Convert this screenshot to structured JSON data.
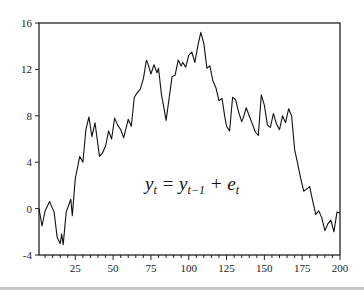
{
  "chart_data": {
    "type": "line",
    "title": "",
    "xlabel": "",
    "ylabel": "",
    "annotation": {
      "text_parts": [
        "y",
        "t",
        " = y",
        "t−1",
        " + e",
        "t"
      ],
      "latex": "y_t = y_{t-1} + e_t",
      "position": "center-lower"
    },
    "xlim": [
      1,
      200
    ],
    "ylim": [
      -4,
      16
    ],
    "grid": false,
    "legend": "none",
    "x_ticks": [
      25,
      50,
      75,
      100,
      125,
      150,
      175,
      200
    ],
    "x_minor_tick_step": 5,
    "y_ticks": [
      -4,
      0,
      4,
      8,
      12,
      16
    ],
    "series": [
      {
        "name": "random walk y_t",
        "color": "#111111",
        "x": [
          1,
          3,
          5,
          8,
          11,
          13,
          15,
          16,
          17,
          19,
          22,
          23,
          25,
          28,
          30,
          32,
          34,
          36,
          38,
          41,
          43,
          45,
          47,
          49,
          51,
          53,
          55,
          57,
          60,
          62,
          64,
          66,
          68,
          70,
          72,
          73,
          75,
          77,
          79,
          80,
          82,
          84,
          85,
          87,
          89,
          91,
          93,
          95,
          96,
          98,
          100,
          102,
          104,
          106,
          108,
          110,
          112,
          114,
          116,
          118,
          120,
          122,
          124,
          125,
          127,
          129,
          131,
          133,
          135,
          136,
          138,
          140,
          142,
          144,
          146,
          148,
          150,
          152,
          154,
          156,
          158,
          160,
          162,
          164,
          166,
          168,
          170,
          172,
          174,
          176,
          178,
          180,
          182,
          184,
          186,
          188,
          190,
          192,
          194,
          196,
          198,
          200
        ],
        "values": [
          0,
          -1.5,
          -0.2,
          0.6,
          -0.3,
          -2.5,
          -3.0,
          -2.2,
          -3.1,
          -0.3,
          0.8,
          -0.6,
          2.6,
          4.5,
          4.0,
          6.8,
          7.9,
          6.2,
          7.4,
          4.5,
          4.8,
          5.4,
          6.7,
          6.0,
          7.8,
          7.2,
          6.8,
          6.1,
          7.7,
          7.1,
          9.6,
          10.0,
          10.3,
          11.2,
          12.8,
          12.5,
          11.6,
          12.4,
          11.7,
          12.1,
          9.8,
          8.4,
          7.6,
          9.5,
          11.4,
          11.5,
          12.8,
          12.3,
          12.6,
          12.2,
          13.2,
          13.5,
          12.6,
          14.0,
          15.2,
          14.2,
          12.1,
          12.3,
          11.0,
          10.4,
          9.3,
          9.5,
          7.8,
          7.1,
          6.7,
          9.6,
          9.4,
          8.3,
          7.5,
          7.8,
          8.7,
          8.0,
          7.3,
          6.6,
          6.3,
          9.8,
          8.9,
          7.2,
          7.0,
          8.2,
          7.3,
          6.8,
          8.0,
          7.4,
          8.6,
          8.0,
          5.1,
          3.9,
          2.6,
          1.5,
          1.7,
          1.9,
          0.6,
          -0.5,
          -0.2,
          -0.8,
          -1.9,
          -1.3,
          -1.0,
          -2.0,
          -0.3,
          -0.4
        ]
      }
    ]
  },
  "layout": {
    "plot": {
      "left": 39,
      "top": 23,
      "right": 340,
      "bottom": 255
    },
    "annotation_xy": [
      145,
      190
    ]
  }
}
